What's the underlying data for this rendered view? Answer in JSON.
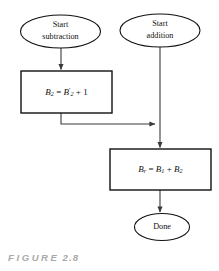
{
  "figure": {
    "caption_word": "FIGURE",
    "caption_number": "2.8"
  },
  "diagram": {
    "type": "flowchart",
    "nodes": [
      {
        "id": "start-subtraction",
        "shape": "ellipse",
        "label_line1": "Start",
        "label_line2": "subtraction"
      },
      {
        "id": "start-addition",
        "shape": "ellipse",
        "label_line1": "Start",
        "label_line2": "addition"
      },
      {
        "id": "process-twos-complement",
        "shape": "rectangle",
        "formula": {
          "lhs_var": "B",
          "lhs_sub": "2",
          "operator": "=",
          "rhs_var": "B",
          "rhs_sub": "2",
          "rhs_prime": "′",
          "plus": "+",
          "addend": "1"
        }
      },
      {
        "id": "process-add",
        "shape": "rectangle",
        "formula": {
          "lhs_var": "B",
          "lhs_sub": "r",
          "operator": "=",
          "term1_var": "B",
          "term1_sub": "1",
          "plus": "+",
          "term2_var": "B",
          "term2_sub": "2"
        }
      },
      {
        "id": "done",
        "shape": "ellipse",
        "label_line1": "Done"
      }
    ],
    "colors": {
      "stroke": "#111111",
      "connector": "#3a3a3a",
      "fill": "#ffffff",
      "caption": "#a8a8a8"
    }
  }
}
